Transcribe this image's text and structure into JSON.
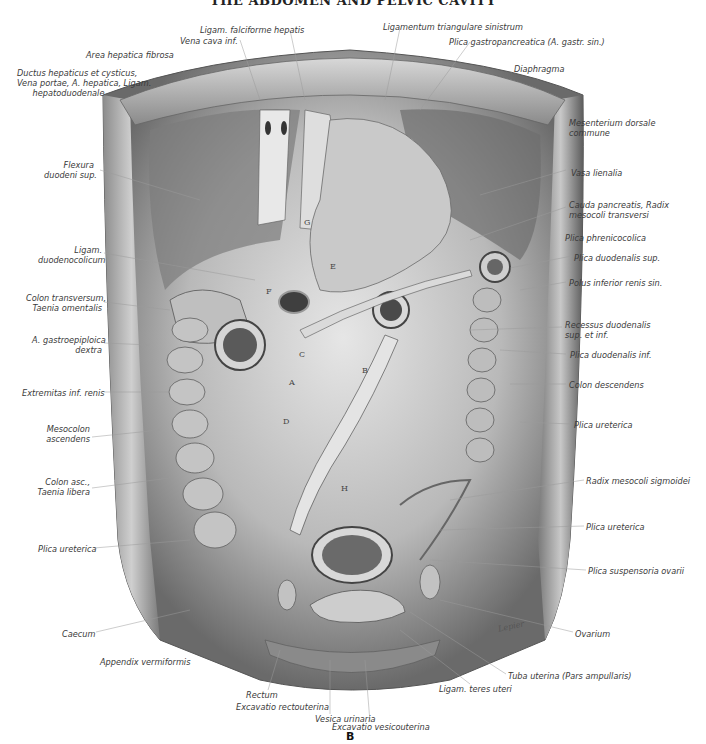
{
  "title": "THE ABDOMEN AND PELVIC CAVITY",
  "figure_id": "B",
  "signature": "Lepier",
  "labels_left": [
    {
      "text": "Ligam. falciforme hepatis",
      "x": 200,
      "y": 25,
      "align": "left"
    },
    {
      "text": "Vena cava inf.",
      "x": 180,
      "y": 36,
      "align": "left"
    },
    {
      "text": "Area hepatica fibrosa",
      "x": 86,
      "y": 50,
      "align": "left"
    },
    {
      "text": "Ductus hepaticus et cysticus,\nVena portae, A. hepatica, Ligam.\n      hepatoduodenale",
      "x": 17,
      "y": 68,
      "align": "left"
    },
    {
      "text": "Flexura\nduodeni sup.",
      "x": 44,
      "y": 160,
      "align": "right",
      "w": 50
    },
    {
      "text": "Ligam.\nduodenocolicum",
      "x": 38,
      "y": 245,
      "align": "right",
      "w": 64
    },
    {
      "text": "Colon transversum,\nTaenia omentalis",
      "x": 26,
      "y": 293,
      "align": "right",
      "w": 76
    },
    {
      "text": "A. gastroepiploica\ndextra",
      "x": 32,
      "y": 335,
      "align": "right",
      "w": 70
    },
    {
      "text": "Extremitas inf. renis",
      "x": 22,
      "y": 388,
      "align": "right",
      "w": 80
    },
    {
      "text": "Mesocolon\nascendens",
      "x": 44,
      "y": 424,
      "align": "right",
      "w": 46
    },
    {
      "text": "Colon asc.,\nTaenia libera",
      "x": 36,
      "y": 477,
      "align": "right",
      "w": 54
    },
    {
      "text": "Plica ureterica",
      "x": 38,
      "y": 544,
      "align": "right",
      "w": 54
    },
    {
      "text": "Caecum",
      "x": 62,
      "y": 629,
      "align": "left"
    },
    {
      "text": "Appendix vermiformis",
      "x": 100,
      "y": 657,
      "align": "left"
    }
  ],
  "labels_right": [
    {
      "text": "Ligamentum triangulare sinistrum",
      "x": 383,
      "y": 22,
      "align": "left"
    },
    {
      "text": "Plica gastropancreatica (A. gastr. sin.)",
      "x": 449,
      "y": 37,
      "align": "left"
    },
    {
      "text": "Diaphragma",
      "x": 514,
      "y": 64,
      "align": "left"
    },
    {
      "text": "Mesenterium dorsale\ncommune",
      "x": 569,
      "y": 118,
      "align": "left"
    },
    {
      "text": "Vasa lienalia",
      "x": 571,
      "y": 168,
      "align": "left"
    },
    {
      "text": "Cauda pancreatis, Radix\nmesocoli transversi",
      "x": 569,
      "y": 200,
      "align": "left"
    },
    {
      "text": "Plica phrenicocolica",
      "x": 565,
      "y": 233,
      "align": "left"
    },
    {
      "text": "Plica duodenalis sup.",
      "x": 574,
      "y": 253,
      "align": "left"
    },
    {
      "text": "Polus inferior renis sin.",
      "x": 569,
      "y": 278,
      "align": "left"
    },
    {
      "text": "Recessus duodenalis\nsup. et inf.",
      "x": 565,
      "y": 320,
      "align": "left"
    },
    {
      "text": "Plica duodenalis inf.",
      "x": 570,
      "y": 350,
      "align": "left"
    },
    {
      "text": "Colon descendens",
      "x": 569,
      "y": 380,
      "align": "left"
    },
    {
      "text": "Plica ureterica",
      "x": 574,
      "y": 420,
      "align": "left"
    },
    {
      "text": "Radix mesocoli sigmoidei",
      "x": 586,
      "y": 476,
      "align": "left"
    },
    {
      "text": "Plica ureterica",
      "x": 586,
      "y": 522,
      "align": "left"
    },
    {
      "text": "Plica suspensoria ovarii",
      "x": 588,
      "y": 566,
      "align": "left"
    },
    {
      "text": "Ovarium",
      "x": 575,
      "y": 629,
      "align": "left"
    },
    {
      "text": "Tuba uterina (Pars ampullaris)",
      "x": 508,
      "y": 671,
      "align": "left"
    },
    {
      "text": "Ligam. teres uteri",
      "x": 439,
      "y": 684,
      "align": "left"
    }
  ],
  "labels_bottom": [
    {
      "text": "Rectum",
      "x": 246,
      "y": 690,
      "align": "left"
    },
    {
      "text": "Excavatio rectouterina",
      "x": 236,
      "y": 702,
      "align": "left"
    },
    {
      "text": "Vesica urinaria",
      "x": 315,
      "y": 714,
      "align": "left"
    },
    {
      "text": "Excavatio vesicouterina",
      "x": 332,
      "y": 722,
      "align": "left"
    }
  ],
  "region_letters": [
    {
      "letter": "G",
      "x": 304,
      "y": 218
    },
    {
      "letter": "E",
      "x": 330,
      "y": 262
    },
    {
      "letter": "F",
      "x": 266,
      "y": 287
    },
    {
      "letter": "C",
      "x": 299,
      "y": 350
    },
    {
      "letter": "A",
      "x": 289,
      "y": 378
    },
    {
      "letter": "B",
      "x": 362,
      "y": 366
    },
    {
      "letter": "D",
      "x": 283,
      "y": 417
    },
    {
      "letter": "H",
      "x": 341,
      "y": 484
    }
  ],
  "colors": {
    "ink": "#3a3a3a",
    "tissue_light": "#dcdcdc",
    "tissue_mid": "#9a9a9a",
    "tissue_dark": "#4a4a4a"
  }
}
